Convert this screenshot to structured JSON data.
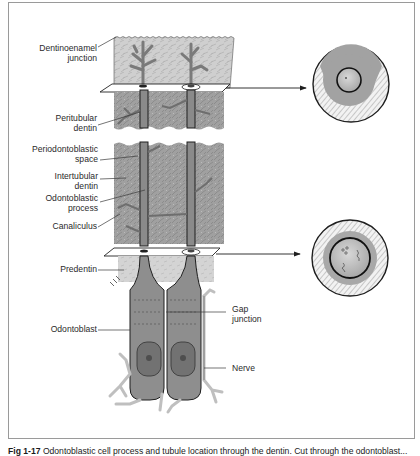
{
  "figure": {
    "caption_label": "Fig 1-17",
    "caption_text": "Odontoblastic cell process and tubule location through the dentin. Cut through the odontoblast..."
  },
  "labels": {
    "dentinoenamel_junction": "Dentinoenamel\njunction",
    "peritubular_dentin": "Peritubular\ndentin",
    "periodontoblastic_space": "Periodontoblastic\nspace",
    "intertubular_dentin": "Intertubular\ndentin",
    "odontoblastic_process": "Odontoblastic\nprocess",
    "canaliculus": "Canaliculus",
    "predentin": "Predentin",
    "odontoblast": "Odontoblast",
    "gap_junction": "Gap\njunction",
    "nerve": "Nerve"
  },
  "colors": {
    "enamel_zone": "#c9c9c9",
    "dentin": "#9c9c9c",
    "process": "#8a8a8a",
    "cell": "#8e8e8e",
    "nucleus": "#6f6f6f",
    "outline": "#1e1e1e",
    "frame": "#9a9a9a"
  }
}
